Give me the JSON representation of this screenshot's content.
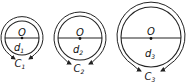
{
  "diagram": {
    "circles": [
      {
        "center_label": "O",
        "diameter_label": "d",
        "diameter_sub": "1",
        "circumference_label": "C",
        "circumference_sub": "1",
        "cx": 22,
        "cy": 38,
        "r": 17,
        "outer_r": 21
      },
      {
        "center_label": "O",
        "diameter_label": "d",
        "diameter_sub": "2",
        "circumference_label": "C",
        "circumference_sub": "2",
        "cx": 80,
        "cy": 38,
        "r": 22,
        "outer_r": 26
      },
      {
        "center_label": "O",
        "diameter_label": "d",
        "diameter_sub": "3",
        "circumference_label": "C",
        "circumference_sub": "3",
        "cx": 151,
        "cy": 37,
        "r": 30,
        "outer_r": 34
      }
    ],
    "colors": {
      "stroke": "#222222",
      "background": "#ffffff"
    }
  }
}
